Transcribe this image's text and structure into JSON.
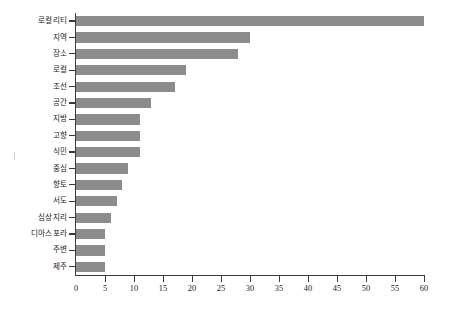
{
  "chart_data": {
    "type": "bar",
    "orientation": "horizontal",
    "title": "",
    "subtitle": "",
    "xlabel": "",
    "ylabel": "",
    "xlim": [
      0,
      60
    ],
    "ylim": null,
    "grid": false,
    "legend": null,
    "legend_position": "none",
    "bar_color": "#8c8c8c",
    "axis_color": "#3a3a3a",
    "text_color": "#1d1d1d",
    "background_color": "#ffffff",
    "xticks": [
      0,
      5,
      10,
      15,
      20,
      25,
      30,
      35,
      40,
      45,
      50,
      55,
      60
    ],
    "xtick_labels": [
      "0",
      "5",
      "10",
      "15",
      "20",
      "25",
      "30",
      "35",
      "40",
      "45",
      "50",
      "55",
      "60"
    ],
    "categories": [
      "로컬리티",
      "지역",
      "장소",
      "로컬",
      "조선",
      "공간",
      "지방",
      "고향",
      "식민",
      "중심",
      "향토",
      "서도",
      "심상지리",
      "디아스포라",
      "주변",
      "제주"
    ],
    "values": [
      60,
      30,
      28,
      19,
      17,
      13,
      11,
      11,
      11,
      9,
      8,
      7,
      6,
      5,
      5,
      5
    ]
  }
}
